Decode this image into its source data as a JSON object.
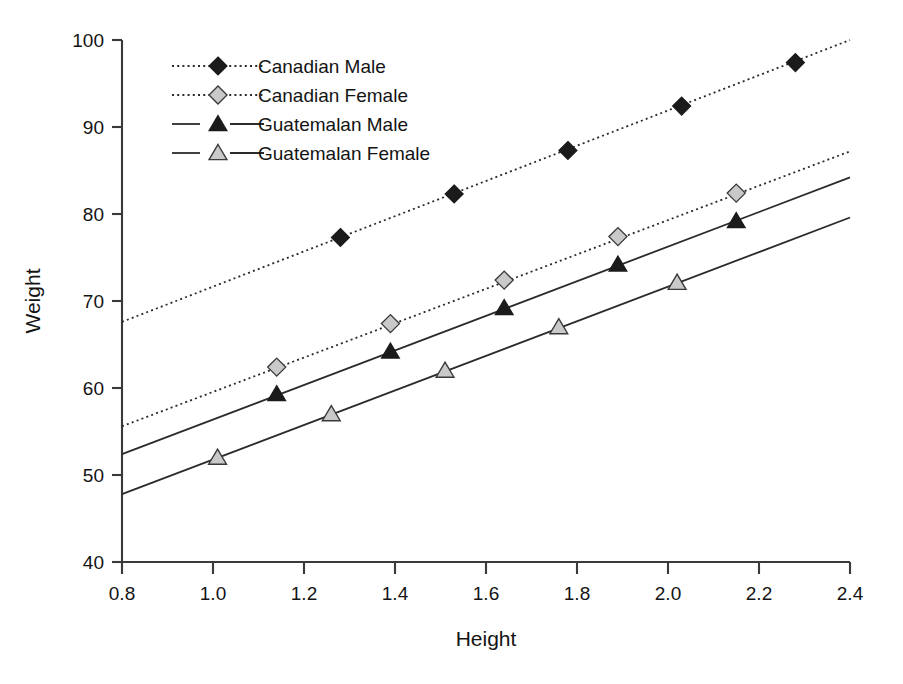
{
  "chart_data": {
    "type": "line",
    "title": "",
    "xlabel": "Height",
    "ylabel": "Weight",
    "xlim": [
      0.8,
      2.4
    ],
    "ylim": [
      40,
      100
    ],
    "xticks": [
      "0.8",
      "1.0",
      "1.2",
      "1.4",
      "1.6",
      "1.8",
      "2.0",
      "2.2",
      "2.4"
    ],
    "xtick_values": [
      0.8,
      1.0,
      1.2,
      1.4,
      1.6,
      1.8,
      2.0,
      2.2,
      2.4
    ],
    "yticks": [
      "40",
      "50",
      "60",
      "70",
      "80",
      "90",
      "100"
    ],
    "ytick_values": [
      40,
      50,
      60,
      70,
      80,
      90,
      100
    ],
    "grid": false,
    "legend_position": "upper-left-inside",
    "series": [
      {
        "name": "Canadian Male",
        "linestyle": "dotted",
        "marker": "diamond",
        "marker_fill": "#1b1b1b",
        "line_start": [
          0.8,
          67.6
        ],
        "line_end": [
          2.4,
          100.0
        ],
        "x": [
          1.28,
          1.53,
          1.78,
          2.03,
          2.28
        ],
        "y": [
          77.3,
          82.3,
          87.3,
          92.4,
          97.4
        ]
      },
      {
        "name": "Canadian Female",
        "linestyle": "dotted",
        "marker": "diamond",
        "marker_fill": "#c9c9c9",
        "line_start": [
          0.8,
          55.6
        ],
        "line_end": [
          2.4,
          87.2
        ],
        "x": [
          1.14,
          1.39,
          1.64,
          1.89,
          2.15
        ],
        "y": [
          62.4,
          67.4,
          72.4,
          77.4,
          82.4
        ]
      },
      {
        "name": "Guatemalan Male",
        "linestyle": "dashed",
        "marker": "triangle",
        "marker_fill": "#1b1b1b",
        "line_start": [
          0.8,
          52.4
        ],
        "line_end": [
          2.4,
          84.2
        ],
        "x": [
          1.14,
          1.39,
          1.64,
          1.89,
          2.15
        ],
        "y": [
          59.3,
          64.2,
          69.2,
          74.2,
          79.2
        ]
      },
      {
        "name": "Guatemalan Female",
        "linestyle": "dashed",
        "marker": "triangle",
        "marker_fill": "#c9c9c9",
        "line_start": [
          0.8,
          47.8
        ],
        "line_end": [
          2.4,
          79.6
        ],
        "x": [
          1.01,
          1.26,
          1.51,
          1.76,
          2.02
        ],
        "y": [
          52.0,
          57.0,
          62.0,
          67.0,
          72.1
        ]
      }
    ],
    "colors": {
      "axis": "#3a3a3a",
      "line": "#2b2b2b",
      "marker_dark": "#1b1b1b",
      "marker_light": "#c9c9c9",
      "background": "#ffffff"
    }
  },
  "legend": {
    "items": [
      {
        "label": "Canadian Male"
      },
      {
        "label": "Canadian Female"
      },
      {
        "label": "Guatemalan Male"
      },
      {
        "label": "Guatemalan Female"
      }
    ]
  }
}
